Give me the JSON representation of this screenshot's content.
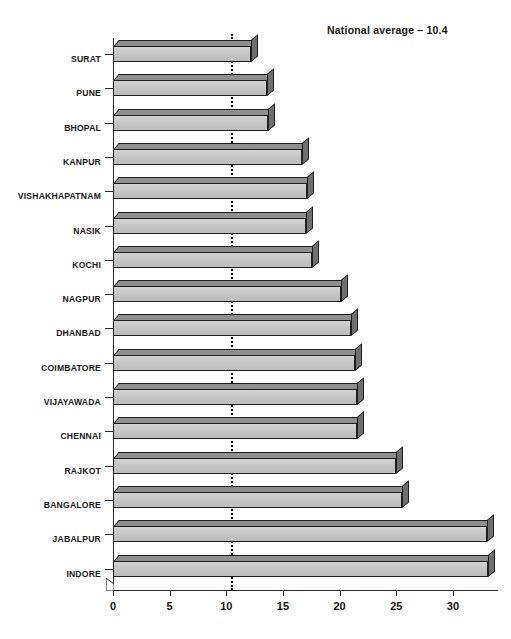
{
  "figure": {
    "top_cropped_heading": "",
    "caption": "",
    "annotation": "National average – 10.4"
  },
  "axis": {
    "x_ticks": [
      0,
      5,
      10,
      15,
      20,
      25,
      30
    ],
    "x_tick_labels": [
      "0",
      "5",
      "10",
      "15",
      "20",
      "25",
      "30"
    ]
  },
  "chart_data": {
    "type": "bar",
    "orientation": "horizontal",
    "title": "",
    "xlabel": "",
    "ylabel": "",
    "xlim": [
      0,
      34
    ],
    "grid": false,
    "legend": null,
    "categories": [
      "SURAT",
      "PUNE",
      "BHOPAL",
      "KANPUR",
      "VISHAKHAPATNAM",
      "NASIK",
      "KOCHI",
      "NAGPUR",
      "DHANBAD",
      "COIMBATORE",
      "VIJAYAWADA",
      "CHENNAI",
      "RAJKOT",
      "BANGALORE",
      "JABALPUR",
      "INDORE"
    ],
    "values": [
      12.2,
      13.6,
      13.7,
      16.7,
      17.1,
      17.0,
      17.6,
      20.1,
      21.0,
      21.4,
      21.5,
      21.5,
      25.0,
      25.5,
      33.0,
      33.1
    ],
    "annotations": [
      {
        "label": "National average – 10.4",
        "type": "reference-line",
        "axis": "x",
        "value": 10.4,
        "style": "dotted"
      }
    ],
    "colors": {
      "bar_face": "#c9c9c9",
      "bar_top": "#8f8f8f",
      "bar_side": "#6f6f6f",
      "outline": "#1e1e1e",
      "reference_line": "#111111",
      "background": "#ffffff"
    }
  }
}
